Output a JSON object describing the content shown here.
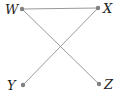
{
  "diagram": {
    "type": "graph",
    "colors": {
      "edge": "#9a9a9a",
      "node": "#808080",
      "label": "#222222",
      "background": "#ffffff"
    },
    "nodes": [
      {
        "id": "W",
        "label": "W",
        "x": 22,
        "y": 9,
        "label_x": 5,
        "label_y": 14
      },
      {
        "id": "X",
        "label": "X",
        "x": 98,
        "y": 8,
        "label_x": 103,
        "label_y": 13
      },
      {
        "id": "Y",
        "label": "Y",
        "x": 23,
        "y": 85,
        "label_x": 7,
        "label_y": 90
      },
      {
        "id": "Z",
        "label": "Z",
        "x": 99,
        "y": 84,
        "label_x": 104,
        "label_y": 89
      }
    ],
    "edges": [
      {
        "from": "W",
        "to": "X"
      },
      {
        "from": "W",
        "to": "Z"
      },
      {
        "from": "X",
        "to": "Y"
      }
    ]
  }
}
